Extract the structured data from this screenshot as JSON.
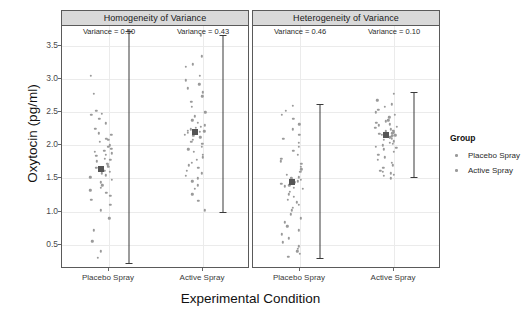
{
  "chart_data": {
    "type": "scatter",
    "title": "",
    "xlabel": "Experimental Condition",
    "ylabel": "Oxytocin (pg/ml)",
    "ylim": [
      0.15,
      3.8
    ],
    "yticks": [
      0.5,
      1.0,
      1.5,
      2.0,
      2.5,
      3.0,
      3.5
    ],
    "ytick_labels": [
      "0.5",
      "1.0",
      "1.5",
      "2.0",
      "2.5",
      "3.0",
      "3.5"
    ],
    "grid": true,
    "legend_position": "right",
    "legend_title": "Group",
    "legend_entries": [
      "Placebo Spray",
      "Active Spray"
    ],
    "facets": [
      {
        "label": "Homogeneity of Variance",
        "groups": [
          {
            "name": "Placebo Spray",
            "annotation": "Variance = 0.50",
            "variance": 0.5,
            "mean": 1.65,
            "error_low": 0.22,
            "error_high": 3.72,
            "values": [
              3.7,
              3.05,
              2.78,
              2.52,
              2.48,
              2.46,
              2.4,
              2.33,
              2.25,
              2.18,
              2.16,
              2.1,
              2.08,
              2.05,
              2.0,
              1.98,
              1.95,
              1.92,
              1.9,
              1.88,
              1.86,
              1.84,
              1.8,
              1.78,
              1.76,
              1.72,
              1.7,
              1.68,
              1.66,
              1.64,
              1.62,
              1.6,
              1.58,
              1.55,
              1.52,
              1.48,
              1.44,
              1.4,
              1.36,
              1.32,
              1.28,
              1.24,
              1.18,
              1.1,
              1.02,
              0.9,
              0.72,
              0.55,
              0.4,
              0.3
            ]
          },
          {
            "name": "Active Spray",
            "annotation": "Variance = 0.43",
            "variance": 0.43,
            "mean": 2.2,
            "error_low": 1.0,
            "error_high": 3.66,
            "values": [
              3.66,
              3.34,
              3.22,
              3.18,
              3.05,
              2.98,
              2.92,
              2.86,
              2.8,
              2.74,
              2.66,
              2.58,
              2.5,
              2.44,
              2.38,
              2.34,
              2.3,
              2.28,
              2.26,
              2.24,
              2.22,
              2.21,
              2.2,
              2.19,
              2.18,
              2.16,
              2.14,
              2.12,
              2.08,
              2.05,
              2.02,
              1.98,
              1.94,
              1.9,
              1.86,
              1.82,
              1.78,
              1.74,
              1.7,
              1.66,
              1.62,
              1.58,
              1.54,
              1.5,
              1.46,
              1.4,
              1.34,
              1.26,
              1.16,
              1.02
            ]
          }
        ]
      },
      {
        "label": "Heterogeneity of Variance",
        "groups": [
          {
            "name": "Placebo Spray",
            "annotation": "Variance = 0.46",
            "variance": 0.46,
            "mean": 1.45,
            "error_low": 0.3,
            "error_high": 2.62,
            "values": [
              2.6,
              2.52,
              2.46,
              2.4,
              2.32,
              2.24,
              2.16,
              2.1,
              2.04,
              1.98,
              1.92,
              1.86,
              1.8,
              1.76,
              1.72,
              1.68,
              1.64,
              1.6,
              1.56,
              1.52,
              1.5,
              1.48,
              1.46,
              1.44,
              1.42,
              1.4,
              1.38,
              1.36,
              1.34,
              1.3,
              1.26,
              1.22,
              1.18,
              1.14,
              1.1,
              1.06,
              1.02,
              0.96,
              0.9,
              0.84,
              0.78,
              0.72,
              0.66,
              0.6,
              0.54,
              0.48,
              0.44,
              0.4,
              0.36,
              0.32
            ]
          },
          {
            "name": "Active Spray",
            "annotation": "Variance = 0.10",
            "variance": 0.1,
            "mean": 2.16,
            "error_low": 1.52,
            "error_high": 2.8,
            "values": [
              2.78,
              2.68,
              2.62,
              2.58,
              2.54,
              2.5,
              2.46,
              2.42,
              2.38,
              2.36,
              2.34,
              2.32,
              2.3,
              2.28,
              2.26,
              2.24,
              2.22,
              2.21,
              2.2,
              2.19,
              2.18,
              2.17,
              2.16,
              2.15,
              2.14,
              2.13,
              2.12,
              2.11,
              2.1,
              2.08,
              2.06,
              2.04,
              2.02,
              2.0,
              1.98,
              1.96,
              1.94,
              1.9,
              1.86,
              1.82,
              1.78,
              1.74,
              1.7,
              1.66,
              1.62,
              1.6,
              1.58,
              1.56,
              1.54,
              1.5
            ]
          }
        ]
      }
    ]
  },
  "colors": {
    "point": "#9a9a9a",
    "mean": "#555555",
    "errorbar": "#3a3a3a",
    "strip": "#d9d9d9",
    "grid": "#ebebeb",
    "panel_border": "#5a5a5a"
  }
}
